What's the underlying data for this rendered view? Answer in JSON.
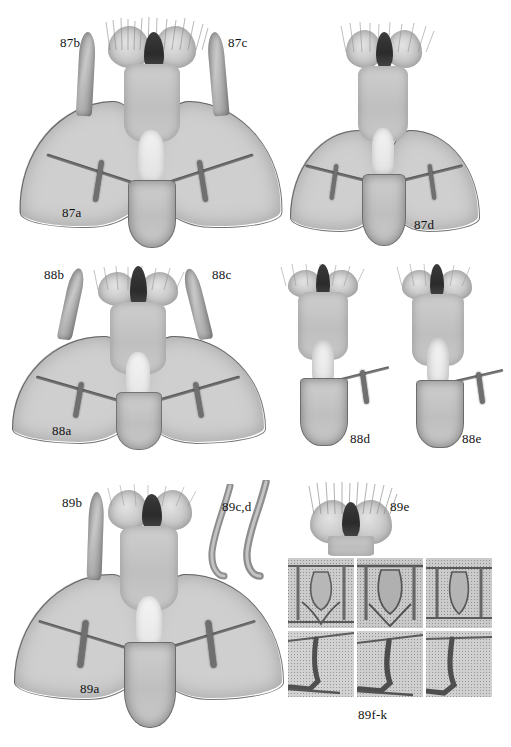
{
  "plate": {
    "background_color": "#ffffff",
    "ink_color": "#111111",
    "specimen_tone": "#cfcfcf",
    "dark_tone": "#3b3b3b",
    "width": 511,
    "height": 747,
    "description": "Monochrome scientific plate of moth male genitalia preparations, three figure groups numbered 87, 88 and 89."
  },
  "groups": [
    {
      "id": "87",
      "panels": [
        {
          "label": "87a",
          "type": "whole-genitalia-ventral",
          "x": 62,
          "y": 214
        },
        {
          "label": "87b",
          "type": "aedeagus-lateral",
          "x": 62,
          "y": 42
        },
        {
          "label": "87c",
          "type": "aedeagus-lateral",
          "x": 228,
          "y": 42
        },
        {
          "label": "87d",
          "type": "whole-genitalia-ventral",
          "x": 414,
          "y": 224
        }
      ]
    },
    {
      "id": "88",
      "panels": [
        {
          "label": "88a",
          "type": "whole-genitalia-ventral",
          "x": 54,
          "y": 428
        },
        {
          "label": "88b",
          "type": "aedeagus-lateral",
          "x": 46,
          "y": 272
        },
        {
          "label": "88c",
          "type": "aedeagus-lateral",
          "x": 213,
          "y": 272
        },
        {
          "label": "88d",
          "type": "genitalia-partial",
          "x": 352,
          "y": 432
        },
        {
          "label": "88e",
          "type": "genitalia-partial",
          "x": 464,
          "y": 432
        }
      ]
    },
    {
      "id": "89",
      "panels": [
        {
          "label": "89a",
          "type": "whole-genitalia-ventral",
          "x": 82,
          "y": 690
        },
        {
          "label": "89b",
          "type": "aedeagus-lateral",
          "x": 72,
          "y": 500
        },
        {
          "label": "89c,d",
          "type": "aedeagus-lateral-pair",
          "x": 228,
          "y": 507
        },
        {
          "label": "89e",
          "type": "uncus-tegumen-detail",
          "x": 393,
          "y": 507
        },
        {
          "label": "89f-k",
          "type": "detail-grid-3x2",
          "x": 360,
          "y": 714
        }
      ]
    }
  ],
  "detail_grid": {
    "label": "89f-k",
    "columns": 3,
    "rows": 2,
    "tiles": [
      {
        "index": "f",
        "row": 1,
        "col": 1,
        "content": "juxta-close-up"
      },
      {
        "index": "g",
        "row": 1,
        "col": 2,
        "content": "juxta-close-up"
      },
      {
        "index": "h",
        "row": 1,
        "col": 3,
        "content": "juxta-close-up"
      },
      {
        "index": "i",
        "row": 2,
        "col": 1,
        "content": "harpe-close-up"
      },
      {
        "index": "j",
        "row": 2,
        "col": 2,
        "content": "harpe-close-up"
      },
      {
        "index": "k",
        "row": 2,
        "col": 3,
        "content": "harpe-close-up"
      }
    ]
  },
  "labels": {
    "g87a": "87a",
    "g87b": "87b",
    "g87c": "87c",
    "g87d": "87d",
    "g88a": "88a",
    "g88b": "88b",
    "g88c": "88c",
    "g88d": "88d",
    "g88e": "88e",
    "g89a": "89a",
    "g89b": "89b",
    "g89cd": "89c,d",
    "g89e": "89e",
    "g89fk": "89f-k"
  }
}
